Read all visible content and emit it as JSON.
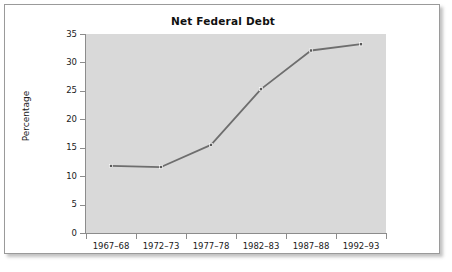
{
  "figure": {
    "title": "Net Federal Debt",
    "y_axis_title": "Percentage"
  },
  "chart_data": {
    "type": "line",
    "title": "Net Federal Debt",
    "xlabel": "",
    "ylabel": "Percentage",
    "categories": [
      "1967–68",
      "1972–73",
      "1977–78",
      "1982–83",
      "1987–88",
      "1992–93"
    ],
    "values": [
      11.8,
      11.6,
      15.5,
      25.3,
      32.1,
      33.2
    ],
    "ylim": [
      0,
      35
    ],
    "yticks": [
      0,
      5,
      10,
      15,
      20,
      25,
      30,
      35
    ],
    "ytick_labels": [
      "0",
      "5",
      "10",
      "15",
      "20",
      "25",
      "30",
      "35"
    ],
    "grid": false,
    "legend": false,
    "line_color": "#6e6e6e",
    "marker": "square",
    "marker_color": "#5a5a5a",
    "plot_background": "#d9d9d9",
    "axis_color": "#8c8c8c"
  }
}
